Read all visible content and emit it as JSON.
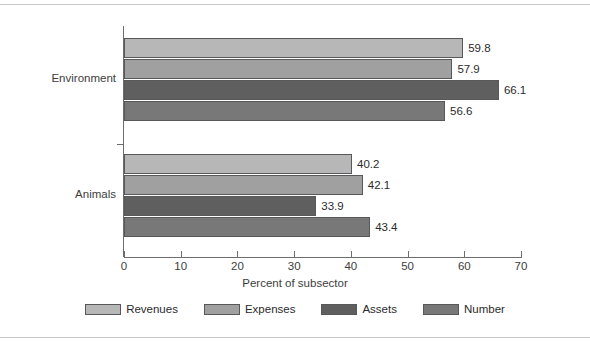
{
  "chart_data": {
    "type": "bar",
    "orientation": "horizontal",
    "title": "",
    "xlabel": "Percent of subsector",
    "ylabel": "",
    "xlim": [
      0,
      70
    ],
    "xticks": [
      0,
      10,
      20,
      30,
      40,
      50,
      60,
      70
    ],
    "grid": false,
    "legend_position": "bottom",
    "categories": [
      "Environment",
      "Animals"
    ],
    "series": [
      {
        "name": "Revenues",
        "color": "#b7b7b7",
        "values": [
          59.8,
          40.2
        ]
      },
      {
        "name": "Expenses",
        "color": "#a0a0a0",
        "values": [
          57.9,
          42.1
        ]
      },
      {
        "name": "Assets",
        "color": "#5f5f5f",
        "values": [
          66.1,
          33.9
        ]
      },
      {
        "name": "Number",
        "color": "#787878",
        "values": [
          56.6,
          43.4
        ]
      }
    ],
    "value_labels": {
      "Environment": [
        "59.8",
        "57.9",
        "66.1",
        "56.6"
      ],
      "Animals": [
        "40.2",
        "42.1",
        "33.9",
        "43.4"
      ]
    },
    "tick_labels": [
      "0",
      "10",
      "20",
      "30",
      "40",
      "50",
      "60",
      "70"
    ],
    "legend_entries": [
      "Revenues",
      "Expenses",
      "Assets",
      "Number"
    ]
  }
}
